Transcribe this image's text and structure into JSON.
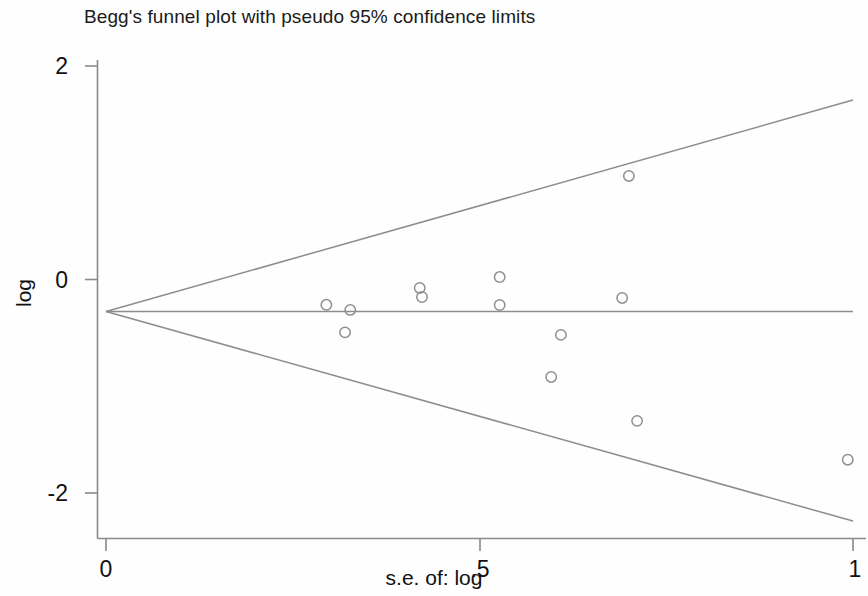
{
  "chart_data": {
    "type": "scatter",
    "title": "Begg's funnel plot with pseudo 95% confidence limits",
    "xlabel": "s.e. of: log",
    "ylabel": "log",
    "xlim": [
      -0.015,
      1.0
    ],
    "ylim": [
      -2.45,
      2.25
    ],
    "xticks": [
      0,
      0.5,
      1
    ],
    "xticklabels": [
      "0",
      ".5",
      "1"
    ],
    "yticks": [
      2,
      0,
      -2
    ],
    "yticklabels": [
      "2",
      "0",
      "-2"
    ],
    "grid": false,
    "legend": false,
    "pooled_effect": -0.3,
    "points": [
      {
        "x": 0.295,
        "y": -0.237
      },
      {
        "x": 0.327,
        "y": -0.285
      },
      {
        "x": 0.32,
        "y": -0.495
      },
      {
        "x": 0.42,
        "y": -0.079
      },
      {
        "x": 0.423,
        "y": -0.164
      },
      {
        "x": 0.527,
        "y": 0.023
      },
      {
        "x": 0.527,
        "y": -0.239
      },
      {
        "x": 0.609,
        "y": -0.519
      },
      {
        "x": 0.596,
        "y": -0.913
      },
      {
        "x": 0.7,
        "y": 0.97
      },
      {
        "x": 0.691,
        "y": -0.173
      },
      {
        "x": 0.711,
        "y": -1.324
      },
      {
        "x": 0.993,
        "y": -1.688
      }
    ],
    "funnel_lines": {
      "apex": {
        "x": 0.0,
        "y": -0.3
      },
      "upper_end": {
        "x": 1.0,
        "y": 1.682
      },
      "lower_end": {
        "x": 1.0,
        "y": -2.263
      },
      "center_end": {
        "x": 1.0,
        "y": -0.3
      }
    }
  },
  "axes": {
    "y_labels": [
      "2",
      "0",
      "-2"
    ],
    "x_labels": [
      "0",
      ".5",
      "1"
    ],
    "x_title": "s.e. of: log",
    "y_title": "log"
  },
  "title": "Begg's funnel plot with pseudo 95% confidence limits"
}
